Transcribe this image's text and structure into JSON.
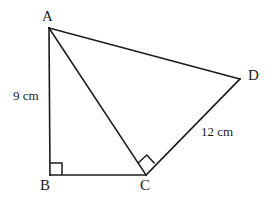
{
  "figure": {
    "background_color": "#ffffff",
    "stroke_color": "#1b1b1b",
    "vertices": [
      {
        "name": "A",
        "label": "A",
        "x": 49,
        "y": 28
      },
      {
        "name": "B",
        "label": "B",
        "x": 50,
        "y": 175
      },
      {
        "name": "C",
        "label": "C",
        "x": 146,
        "y": 175
      },
      {
        "name": "D",
        "label": "D",
        "x": 240,
        "y": 79
      }
    ],
    "segments": [
      {
        "name": "segment-AB",
        "from": "A",
        "to": "B"
      },
      {
        "name": "segment-BC",
        "from": "B",
        "to": "C"
      },
      {
        "name": "segment-AC",
        "from": "A",
        "to": "C"
      },
      {
        "name": "segment-AD",
        "from": "A",
        "to": "D"
      },
      {
        "name": "segment-CD",
        "from": "C",
        "to": "D"
      }
    ],
    "right_angles": [
      {
        "name": "right-angle-B",
        "at": "B",
        "type": "axis-aligned-square"
      },
      {
        "name": "right-angle-C",
        "at": "C",
        "type": "rotated-square"
      }
    ],
    "measurements": {
      "ab_length": "9 cm",
      "cd_length": "12 cm"
    },
    "labels": {
      "a": "A",
      "b": "B",
      "c": "C",
      "d": "D"
    }
  }
}
